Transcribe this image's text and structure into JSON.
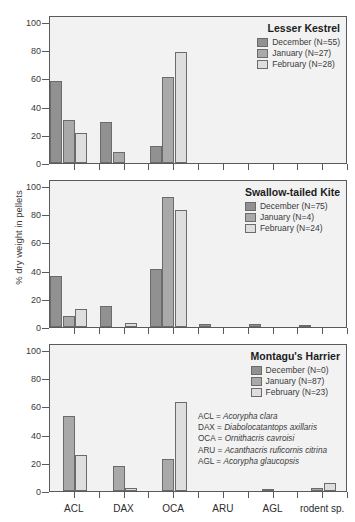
{
  "chart_data": {
    "type": "bar",
    "title": "",
    "xlabel": "",
    "ylabel": "% dry weight in pellets",
    "ylim": [
      0,
      105
    ],
    "yticks": [
      0,
      20,
      40,
      60,
      80,
      100
    ],
    "grid": false,
    "legend_position": "top-right",
    "categories": [
      "ACL",
      "DAX",
      "OCA",
      "ARU",
      "AGL",
      "rodent sp."
    ],
    "panels": [
      {
        "title": "Lesser Kestrel",
        "series": [
          {
            "name": "December (N=55)",
            "color": "#919191",
            "values": [
              58,
              29,
              12,
              0,
              0,
              0
            ]
          },
          {
            "name": "January (N=27)",
            "color": "#a9a9a9",
            "values": [
              30.5,
              8,
              61,
              0,
              0,
              0
            ]
          },
          {
            "name": "February (N=28)",
            "color": "#dedede",
            "values": [
              21.5,
              0,
              79,
              0,
              0,
              0
            ]
          }
        ]
      },
      {
        "title": "Swallow-tailed Kite",
        "series": [
          {
            "name": "December (N=75)",
            "color": "#919191",
            "values": [
              36,
              15,
              41.5,
              2,
              2,
              1
            ]
          },
          {
            "name": "January (N=4)",
            "color": "#a9a9a9",
            "values": [
              7.5,
              0,
              92.5,
              0,
              0,
              0
            ]
          },
          {
            "name": "February (N=24)",
            "color": "#dedede",
            "values": [
              13,
              3,
              83,
              0,
              0,
              0
            ]
          }
        ]
      },
      {
        "title": "Montagu's Harrier",
        "series": [
          {
            "name": "December (N=0)",
            "color": "#919191",
            "values": [
              0,
              0,
              0,
              0,
              0,
              0
            ]
          },
          {
            "name": "January (N=87)",
            "color": "#a9a9a9",
            "values": [
              53,
              17.5,
              22.5,
              0,
              0.5,
              2
            ]
          },
          {
            "name": "February (N=23)",
            "color": "#dedede",
            "values": [
              25.5,
              2,
              63.5,
              0,
              0,
              6
            ]
          }
        ]
      }
    ],
    "annotations": {
      "species_key": [
        {
          "abbr": "ACL = ",
          "sci": "Acorypha clara"
        },
        {
          "abbr": "DAX = ",
          "sci": "Diabolocatantops axillaris"
        },
        {
          "abbr": "OCA = ",
          "sci": "Ornithacris cavroisi"
        },
        {
          "abbr": "ARU = ",
          "sci": "Acanthacris ruficornis citrina"
        },
        {
          "abbr": "AGL = ",
          "sci": "Acorypha glaucopsis"
        }
      ]
    }
  }
}
